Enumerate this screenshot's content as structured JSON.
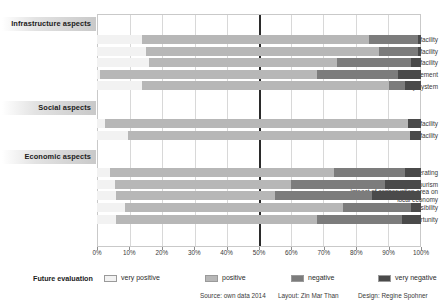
{
  "chart_data": {
    "type": "bar",
    "subtype": "stacked-horizontal-100-percent",
    "title": "",
    "xlabel": "",
    "ylabel": "",
    "xlim": [
      0,
      100
    ],
    "xticks": [
      "0%",
      "10%",
      "20%",
      "30%",
      "40%",
      "50%",
      "60%",
      "70%",
      "80%",
      "90%",
      "100%"
    ],
    "xtick_values": [
      0,
      10,
      20,
      30,
      40,
      50,
      60,
      70,
      80,
      90,
      100
    ],
    "grid": "vertical",
    "reference_line": 50,
    "legend_position": "bottom",
    "legend_title": "Future evaluation",
    "series": [
      {
        "name": "very positive",
        "color": "#f2f2f2"
      },
      {
        "name": "positive",
        "color": "#b7b7b7"
      },
      {
        "name": "negative",
        "color": "#7c7c7c"
      },
      {
        "name": "very negative",
        "color": "#4a4a4a"
      }
    ],
    "groups": [
      {
        "label": "Infrastructure aspects",
        "categories": [
          {
            "label": "information facility",
            "values": [
              14,
              70,
              15,
              1
            ]
          },
          {
            "label": "communication facility",
            "values": [
              15,
              72,
              12,
              1
            ]
          },
          {
            "label": "transportation facility",
            "values": [
              16,
              58,
              23,
              3
            ]
          },
          {
            "label": "waste management",
            "values": [
              1,
              67,
              25,
              7
            ]
          },
          {
            "label": "electricity system",
            "values": [
              14,
              76,
              5,
              5
            ]
          }
        ]
      },
      {
        "label": "Social aspects",
        "categories": [
          {
            "label": "health facility",
            "values": [
              2.5,
              93.5,
              0,
              4
            ]
          },
          {
            "label": "education facility",
            "values": [
              9.5,
              87,
              0,
              3.5
            ]
          }
        ]
      },
      {
        "label": "Economic aspects",
        "categories": [
          {
            "label": "income generating",
            "values": [
              4,
              69,
              22,
              5
            ]
          },
          {
            "label": "eco-tourism",
            "values": [
              5.5,
              54.5,
              29,
              11
            ]
          },
          {
            "label": "impact of conservation area on local economy",
            "values": [
              6,
              49,
              30,
              15
            ]
          },
          {
            "label": "market accessibility",
            "values": [
              8.5,
              67.5,
              21,
              3
            ]
          },
          {
            "label": "job opportunity",
            "values": [
              6,
              62,
              26,
              6
            ]
          }
        ]
      }
    ]
  },
  "legend": {
    "title": "Future evaluation",
    "items": [
      {
        "label": "very positive",
        "color": "#f2f2f2"
      },
      {
        "label": "positive",
        "color": "#b7b7b7"
      },
      {
        "label": "negative",
        "color": "#7c7c7c"
      },
      {
        "label": "very negative",
        "color": "#4a4a4a"
      }
    ]
  },
  "credits": {
    "source": "Source: own data 2014",
    "layout": "Layout: Zin Mar Than",
    "design": "Design: Regine Spohner"
  }
}
